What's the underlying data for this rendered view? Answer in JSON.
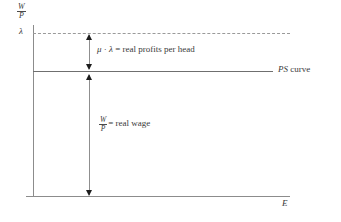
{
  "figure": {
    "type": "economics-diagram"
  },
  "axes": {
    "y_label_numerator": "W",
    "y_label_denominator": "P",
    "x_label": "E",
    "level_tick_label": "λ"
  },
  "lines": {
    "dashed_level": {
      "name": "lambda-level-line",
      "style": "dashed",
      "color": "#9a9a9a"
    },
    "ps_curve": {
      "name": "ps-curve-line",
      "style": "solid",
      "color": "#6f6f6f",
      "label_italic": "PS",
      "label_rest": " curve"
    }
  },
  "annotations": {
    "profits": {
      "mu": "μ",
      "operator": " · ",
      "lambda": "λ",
      "equals": " = ",
      "text": "real profits per head"
    },
    "real_wage": {
      "numerator": "W",
      "denominator": "P",
      "equals": "= ",
      "text": "real wage"
    }
  },
  "colors": {
    "axis": "#8c8c8c",
    "ps_curve": "#6f6f6f",
    "dashed": "#9a9a9a",
    "arrow": "#1d1d1d",
    "text": "#3a3a3a",
    "background": "#ffffff"
  }
}
